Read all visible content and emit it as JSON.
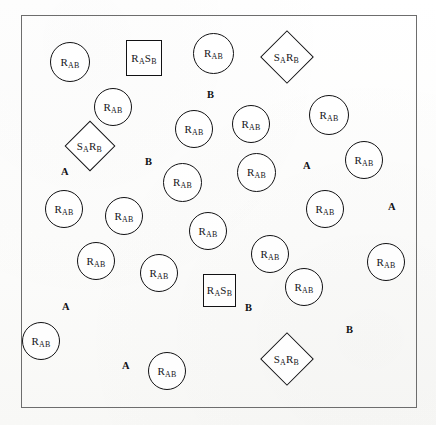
{
  "figure": {
    "kind": "schematic-scatter-diagram",
    "frame": {
      "x": 21,
      "y": 15,
      "width": 396,
      "height": 393,
      "border_color": "#6d6d6d"
    },
    "background_color": "#fdfdfc",
    "ink_color": "#121214",
    "caption_remnant": ""
  },
  "legend_symbols": {
    "circle_label_plain": "RAB",
    "square_label_plain": "RASB",
    "diamond_label_plain": "SARB"
  },
  "shapes": [
    {
      "id": "c1",
      "type": "circle",
      "label": "RAB",
      "base": "R",
      "sub": "AB",
      "x": 50,
      "y": 42,
      "size": 40
    },
    {
      "id": "c2",
      "type": "circle",
      "label": "RAB",
      "base": "R",
      "sub": "AB",
      "x": 94,
      "y": 88,
      "size": 38
    },
    {
      "id": "c3",
      "type": "circle",
      "label": "RAB",
      "base": "R",
      "sub": "AB",
      "x": 193,
      "y": 33,
      "size": 41
    },
    {
      "id": "c4",
      "type": "circle",
      "label": "RAB",
      "base": "R",
      "sub": "AB",
      "x": 309,
      "y": 95,
      "size": 40
    },
    {
      "id": "c5",
      "type": "circle",
      "label": "RAB",
      "base": "R",
      "sub": "AB",
      "x": 175,
      "y": 110,
      "size": 38
    },
    {
      "id": "c6",
      "type": "circle",
      "label": "RAB",
      "base": "R",
      "sub": "AB",
      "x": 232,
      "y": 105,
      "size": 38
    },
    {
      "id": "c7",
      "type": "circle",
      "label": "RAB",
      "base": "R",
      "sub": "AB",
      "x": 345,
      "y": 141,
      "size": 38
    },
    {
      "id": "c8",
      "type": "circle",
      "label": "RAB",
      "base": "R",
      "sub": "AB",
      "x": 237,
      "y": 153,
      "size": 39
    },
    {
      "id": "c9",
      "type": "circle",
      "label": "RAB",
      "base": "R",
      "sub": "AB",
      "x": 163,
      "y": 163,
      "size": 39
    },
    {
      "id": "c10",
      "type": "circle",
      "label": "RAB",
      "base": "R",
      "sub": "AB",
      "x": 45,
      "y": 190,
      "size": 38
    },
    {
      "id": "c11",
      "type": "circle",
      "label": "RAB",
      "base": "R",
      "sub": "AB",
      "x": 105,
      "y": 197,
      "size": 38
    },
    {
      "id": "c12",
      "type": "circle",
      "label": "RAB",
      "base": "R",
      "sub": "AB",
      "x": 306,
      "y": 190,
      "size": 38
    },
    {
      "id": "c13",
      "type": "circle",
      "label": "RAB",
      "base": "R",
      "sub": "AB",
      "x": 189,
      "y": 212,
      "size": 38
    },
    {
      "id": "c14",
      "type": "circle",
      "label": "RAB",
      "base": "R",
      "sub": "AB",
      "x": 251,
      "y": 235,
      "size": 38
    },
    {
      "id": "c15",
      "type": "circle",
      "label": "RAB",
      "base": "R",
      "sub": "AB",
      "x": 77,
      "y": 242,
      "size": 38
    },
    {
      "id": "c16",
      "type": "circle",
      "label": "RAB",
      "base": "R",
      "sub": "AB",
      "x": 140,
      "y": 254,
      "size": 38
    },
    {
      "id": "c17",
      "type": "circle",
      "label": "RAB",
      "base": "R",
      "sub": "AB",
      "x": 367,
      "y": 243,
      "size": 38
    },
    {
      "id": "c18",
      "type": "circle",
      "label": "RAB",
      "base": "R",
      "sub": "AB",
      "x": 285,
      "y": 268,
      "size": 38
    },
    {
      "id": "c19",
      "type": "circle",
      "label": "RAB",
      "base": "R",
      "sub": "AB",
      "x": 22,
      "y": 322,
      "size": 38
    },
    {
      "id": "c20",
      "type": "circle",
      "label": "RAB",
      "base": "R",
      "sub": "AB",
      "x": 148,
      "y": 352,
      "size": 38
    },
    {
      "id": "c21",
      "type": "circle",
      "label": "RAB",
      "base": "R",
      "sub": "AB",
      "x": 290,
      "y": 54,
      "size": 0
    },
    {
      "id": "s1",
      "type": "square",
      "label": "RASB",
      "x": 126,
      "y": 40,
      "size": 36
    },
    {
      "id": "s2",
      "type": "square",
      "label": "RASB",
      "x": 203,
      "y": 274,
      "size": 33
    },
    {
      "id": "d1",
      "type": "diamond",
      "label": "SARB",
      "x": 268,
      "y": 38,
      "size": 38
    },
    {
      "id": "d2",
      "type": "diamond",
      "label": "SARB",
      "x": 72,
      "y": 128,
      "size": 36
    },
    {
      "id": "d3",
      "type": "diamond",
      "label": "SARB",
      "x": 268,
      "y": 340,
      "size": 38
    }
  ],
  "markers": [
    {
      "id": "m1",
      "text": "B",
      "x": 207,
      "y": 90
    },
    {
      "id": "m2",
      "text": "B",
      "x": 145,
      "y": 157
    },
    {
      "id": "m3",
      "text": "A",
      "x": 61,
      "y": 167
    },
    {
      "id": "m4",
      "text": "A",
      "x": 303,
      "y": 161
    },
    {
      "id": "m5",
      "text": "A",
      "x": 388,
      "y": 202
    },
    {
      "id": "m6",
      "text": "A",
      "x": 62,
      "y": 302
    },
    {
      "id": "m7",
      "text": "B",
      "x": 245,
      "y": 303
    },
    {
      "id": "m8",
      "text": "B",
      "x": 346,
      "y": 325
    },
    {
      "id": "m9",
      "text": "A",
      "x": 122,
      "y": 361
    }
  ]
}
